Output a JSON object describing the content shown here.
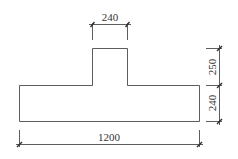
{
  "diagram": {
    "type": "T-section cross-section with dimensions",
    "dimensions": {
      "stem_width": "240",
      "stem_height": "250",
      "base_height": "240",
      "base_width": "1200"
    },
    "colors": {
      "stroke": "#333333",
      "background": "#ffffff"
    }
  }
}
